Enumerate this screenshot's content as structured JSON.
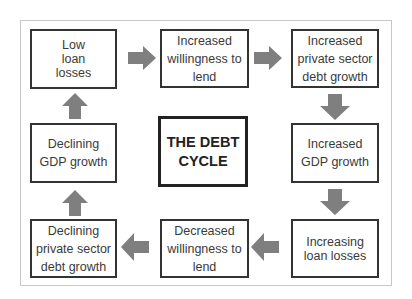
{
  "title": "THE DEBT CYCLE",
  "center": {
    "line1": "THE DEBT",
    "line2": "CYCLE"
  },
  "colors": {
    "border": "#333333",
    "arrow": "#7f7f7f",
    "frame": "#c8c8c8"
  },
  "nodes": [
    {
      "id": "low-loan-losses",
      "text": "Low loan losses"
    },
    {
      "id": "increased-willingness",
      "text": "Increased willingness to lend"
    },
    {
      "id": "increased-private-debt",
      "text": "Increased private sector debt growth"
    },
    {
      "id": "increased-gdp",
      "text": "Increased GDP growth"
    },
    {
      "id": "increasing-loan-losses",
      "text": "Increasing loan losses"
    },
    {
      "id": "decreased-willingness",
      "text": "Decreased willingness to lend"
    },
    {
      "id": "declining-private-debt",
      "text": "Declining private sector debt growth"
    },
    {
      "id": "declining-gdp",
      "text": "Declining GDP growth"
    }
  ],
  "arrows": [
    {
      "from": "low-loan-losses",
      "to": "increased-willingness",
      "direction": "right"
    },
    {
      "from": "increased-willingness",
      "to": "increased-private-debt",
      "direction": "right"
    },
    {
      "from": "increased-private-debt",
      "to": "increased-gdp",
      "direction": "down"
    },
    {
      "from": "increased-gdp",
      "to": "increasing-loan-losses",
      "direction": "down"
    },
    {
      "from": "increasing-loan-losses",
      "to": "decreased-willingness",
      "direction": "left"
    },
    {
      "from": "decreased-willingness",
      "to": "declining-private-debt",
      "direction": "left"
    },
    {
      "from": "declining-private-debt",
      "to": "declining-gdp",
      "direction": "up"
    },
    {
      "from": "declining-gdp",
      "to": "low-loan-losses",
      "direction": "up"
    }
  ]
}
